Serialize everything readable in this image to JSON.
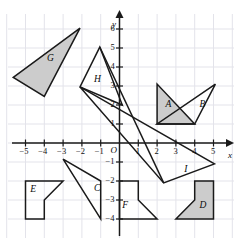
{
  "figure": {
    "type": "coordinate-plane",
    "background": "#ffffff",
    "grid_color": "#e3e3ea",
    "axis_color": "#1a1a1a",
    "shape_stroke": "#1a1a1a",
    "shape_fill_shaded": "#cccccc",
    "shape_fill_plain": "none",
    "origin_px": {
      "x": 119.5,
      "y": 143.0
    },
    "unit_px": {
      "x": 18.8,
      "y": 19.0
    },
    "x_axis": {
      "label": "x",
      "label_px": {
        "x": 228,
        "y": 150
      },
      "range": [
        -6.0,
        6.1
      ],
      "ticks": [
        -5,
        -4,
        -3,
        -2,
        -1,
        1,
        2,
        3,
        4,
        5
      ],
      "tick_labels": [
        "−5",
        "−4",
        "−3",
        "−2",
        "−1",
        "1",
        "2",
        "3",
        "4",
        "5"
      ]
    },
    "y_axis": {
      "label": "y",
      "label_px": {
        "x": 112,
        "y": 19
      },
      "range": [
        -4.6,
        6.5
      ],
      "ticks": [
        6,
        5,
        4,
        3,
        2,
        1,
        -1,
        -2,
        -3,
        -4
      ],
      "tick_labels": [
        "6",
        "5",
        "4",
        "3",
        "2",
        "1",
        "−1",
        "−2",
        "−3",
        "−4"
      ]
    },
    "origin": {
      "label": "O"
    },
    "grid": {
      "x_lines": [
        -6,
        -5,
        -4,
        -3,
        -2,
        -1,
        0,
        1,
        2,
        3,
        4,
        5,
        6
      ],
      "y_lines": [
        6,
        5,
        4,
        3,
        2,
        1,
        0,
        -1,
        -2,
        -3,
        -4
      ]
    },
    "shapes": [
      {
        "id": "A",
        "label": "A",
        "label_pos": {
          "x": 2.45,
          "y": 1.95
        },
        "shaded": true,
        "points": [
          [
            2.0,
            3.1
          ],
          [
            2.0,
            1.0
          ],
          [
            4.0,
            1.0
          ]
        ]
      },
      {
        "id": "B",
        "label": "B",
        "label_pos": {
          "x": 4.25,
          "y": 1.95
        },
        "shaded": false,
        "points": [
          [
            5.1,
            3.1
          ],
          [
            2.0,
            1.0
          ],
          [
            4.0,
            1.0
          ]
        ]
      },
      {
        "id": "D",
        "label": "D",
        "label_pos": {
          "x": 4.25,
          "y": -3.35
        },
        "shaded": true,
        "points": [
          [
            4.0,
            -2.0
          ],
          [
            5.0,
            -2.0
          ],
          [
            5.0,
            -4.0
          ],
          [
            3.0,
            -4.0
          ],
          [
            4.0,
            -3.0
          ]
        ]
      },
      {
        "id": "C",
        "label": "C",
        "label_pos": {
          "x": -1.35,
          "y": -2.45
        },
        "shaded": false,
        "points": [
          [
            -3.0,
            -0.85
          ],
          [
            -1.0,
            -2.0
          ],
          [
            -1.0,
            -4.0
          ]
        ]
      },
      {
        "id": "E",
        "label": "E",
        "label_pos": {
          "x": -4.75,
          "y": -2.55
        },
        "shaded": false,
        "points": [
          [
            -5.0,
            -2.0
          ],
          [
            -3.0,
            -2.0
          ],
          [
            -4.0,
            -3.0
          ],
          [
            -4.0,
            -4.0
          ],
          [
            -5.0,
            -4.0
          ]
        ]
      },
      {
        "id": "F",
        "label": "F",
        "label_pos": {
          "x": 0.15,
          "y": -3.35
        },
        "shaded": false,
        "points": [
          [
            0.0,
            -2.0
          ],
          [
            1.0,
            -2.0
          ],
          [
            1.0,
            -3.0
          ],
          [
            2.0,
            -4.0
          ],
          [
            0.0,
            -4.0
          ]
        ]
      },
      {
        "id": "G",
        "label": "G",
        "label_pos": {
          "x": -3.85,
          "y": 4.35
        },
        "shaded": true,
        "points": [
          [
            -5.65,
            3.45
          ],
          [
            -2.1,
            6.05
          ],
          [
            -4.0,
            2.45
          ]
        ]
      },
      {
        "id": "H",
        "label": "H",
        "label_pos": {
          "x": -1.35,
          "y": 3.25
        },
        "shaded": false,
        "points": [
          [
            -1.05,
            5.05
          ],
          [
            -2.1,
            2.95
          ],
          [
            0.15,
            2.0
          ]
        ]
      },
      {
        "id": "I",
        "label": "I",
        "label_pos": {
          "x": 3.45,
          "y": -1.45
        },
        "shaded": false,
        "points": [
          [
            -2.1,
            2.95
          ],
          [
            5.05,
            -1.1
          ],
          [
            2.35,
            -2.1
          ]
        ]
      },
      {
        "id": "J-line",
        "label": "",
        "label_pos": {
          "x": 0,
          "y": 0
        },
        "shaded": false,
        "points": [
          [
            -1.05,
            5.05
          ],
          [
            2.35,
            -2.1
          ]
        ]
      }
    ]
  }
}
